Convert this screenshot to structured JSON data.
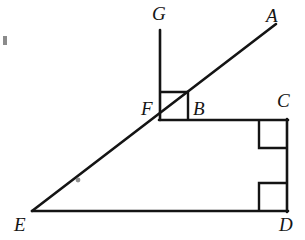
{
  "figure": {
    "type": "geometry-diagram",
    "canvas": {
      "width": 305,
      "height": 240
    },
    "stroke_color": "#141414",
    "background_color": "#ffffff",
    "stroke_width": 2.6,
    "points": {
      "A": {
        "x": 262,
        "y": 32,
        "label": "A",
        "label_x": 266,
        "label_y": 6
      },
      "G": {
        "x": 160,
        "y": 30,
        "label": "G",
        "label_x": 152,
        "label_y": 4
      },
      "F": {
        "x": 160,
        "y": 120,
        "label": "F",
        "label_x": 141,
        "label_y": 99
      },
      "B": {
        "x": 188,
        "y": 120,
        "label": "B",
        "label_x": 193,
        "label_y": 99
      },
      "C": {
        "x": 287,
        "y": 120,
        "label": "C",
        "label_x": 277,
        "label_y": 91
      },
      "D": {
        "x": 287,
        "y": 211,
        "label": "D",
        "label_x": 279,
        "label_y": 215
      },
      "E": {
        "x": 32,
        "y": 211,
        "label": "E",
        "label_x": 14,
        "label_y": 215
      }
    },
    "segments": [
      {
        "name": "ray-E-to-A",
        "from": "E",
        "to": "A",
        "x1": 32,
        "y1": 211,
        "x2": 276,
        "y2": 24
      },
      {
        "name": "segment-G-to-F",
        "from": "G",
        "to": "F",
        "x1": 160,
        "y1": 30,
        "x2": 160,
        "y2": 120
      },
      {
        "name": "segment-F-to-C",
        "from": "F",
        "to": "C",
        "x1": 159,
        "y1": 120,
        "x2": 288,
        "y2": 120
      },
      {
        "name": "segment-C-to-D",
        "from": "C",
        "to": "D",
        "x1": 287,
        "y1": 119,
        "x2": 287,
        "y2": 212
      },
      {
        "name": "segment-E-to-D",
        "from": "E",
        "to": "D",
        "x1": 32,
        "y1": 211,
        "x2": 288,
        "y2": 211
      }
    ],
    "right_angle_marks": [
      {
        "name": "right-angle-at-F",
        "vertex": "F",
        "x": 160,
        "y": 92,
        "size": 28,
        "orientation": "up-right"
      },
      {
        "name": "right-angle-at-C",
        "vertex": "C",
        "x": 259,
        "y": 120,
        "size": 28,
        "orientation": "down-left"
      },
      {
        "name": "right-angle-at-D",
        "vertex": "D",
        "x": 259,
        "y": 183,
        "size": 28,
        "orientation": "up-left"
      }
    ],
    "tick_marks": [
      {
        "name": "tick-on-ray-EA",
        "x": 78,
        "y": 180,
        "radius": 2.6
      }
    ],
    "edge_artifact": {
      "name": "page-edge-speck",
      "x": 3,
      "y": 36,
      "width": 4,
      "height": 9
    }
  }
}
